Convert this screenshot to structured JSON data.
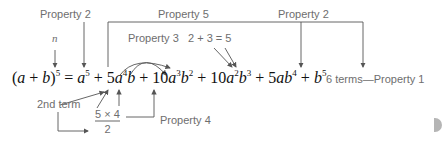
{
  "labels": {
    "property2_left": "Property 2",
    "property5": "Property 5",
    "property2_right": "Property 2",
    "property3": "Property 3",
    "sum": "2 + 3 = 5",
    "n": "n",
    "second_term": "2nd term",
    "property4": "Property 4",
    "six_terms": "6 terms—Property 1"
  },
  "fraction": {
    "numerator": "5 × 4",
    "denominator": "2"
  },
  "equation": {
    "lhs": "(a + b)^5",
    "terms": [
      "a^5",
      "5a^4b",
      "10a^3b^2",
      "10a^2b^3",
      "5ab^4",
      "b^5"
    ]
  },
  "colors": {
    "label": "#6e6e6e",
    "equation": "#111111",
    "arrow": "#555555"
  }
}
